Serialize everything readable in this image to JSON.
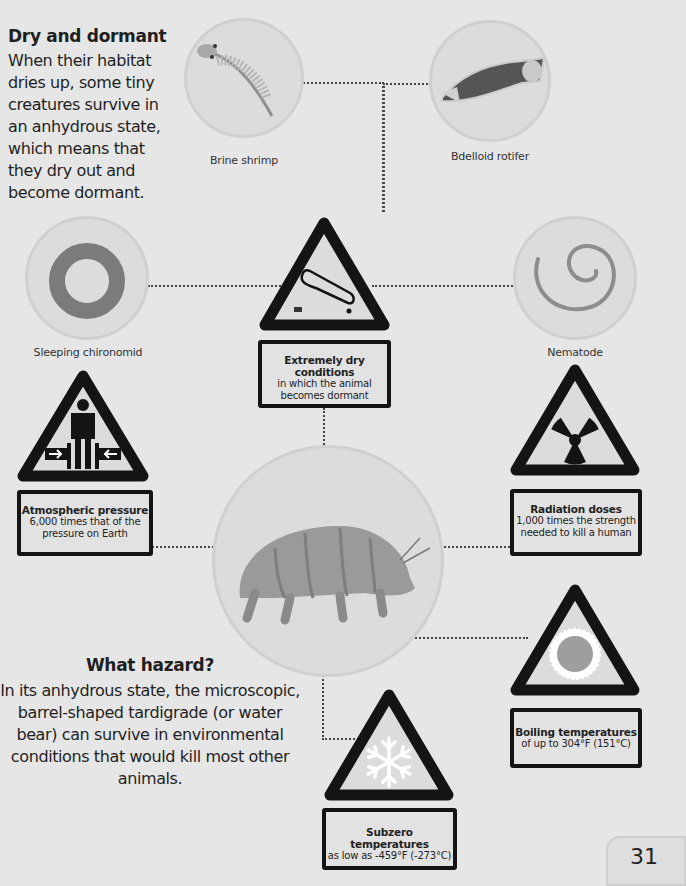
{
  "intro": {
    "title": "Dry and dormant",
    "body": "When their habitat dries up, some tiny creatures survive in an anhydrous state, which means that they dry out and become dormant."
  },
  "hazard_intro": {
    "title": "What hazard?",
    "body": "In its anhydrous state, the microscopic, barrel-shaped tardigrade (or water bear) can survive in environmental conditions that would kill most other animals."
  },
  "creatures": [
    {
      "label": "Brine shrimp",
      "icon": "brine-shrimp-illustration"
    },
    {
      "label": "Bdelloid rotifer",
      "icon": "rotifer-illustration"
    },
    {
      "label": "Sleeping chironomid",
      "icon": "chironomid-illustration"
    },
    {
      "label": "Nematode",
      "icon": "nematode-illustration"
    },
    {
      "label": "",
      "icon": "tardigrade-illustration"
    }
  ],
  "hazards": [
    {
      "title": "Extremely dry conditions",
      "desc": "in which the animal becomes dormant",
      "icon": "dry-organism-sign-icon"
    },
    {
      "title": "Atmospheric pressure",
      "desc": "6,000 times that of the pressure on Earth",
      "icon": "pressure-sign-icon"
    },
    {
      "title": "Radiation doses",
      "desc": "1,000 times the strength needed to kill a human",
      "icon": "radiation-sign-icon"
    },
    {
      "title": "Boiling temperatures",
      "desc": "of up to 304°F (151°C)",
      "icon": "heat-sign-icon"
    },
    {
      "title": "Subzero temperatures",
      "desc": "as low as -459°F (-273°C)",
      "icon": "snowflake-sign-icon"
    }
  ],
  "page": {
    "number": "31"
  },
  "colors": {
    "background": "#e6e6e6",
    "sign_border": "#141414",
    "circle_fill": "#dcdcdc"
  }
}
